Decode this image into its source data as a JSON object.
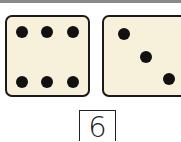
{
  "dice": [
    {
      "name": "left-die",
      "value": 6
    },
    {
      "name": "right-die",
      "value": 3
    }
  ],
  "answer": {
    "value": "6"
  },
  "colors": {
    "die_face": "#f7f1dc",
    "pip": "#111111",
    "border": "#1a1a1a",
    "top_strip": "#8a8a8a"
  }
}
